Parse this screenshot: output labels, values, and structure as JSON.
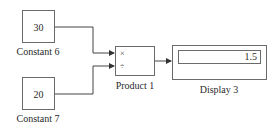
{
  "diagram": {
    "blocks": {
      "constant6": {
        "value": "30",
        "label": "Constant 6"
      },
      "constant7": {
        "value": "20",
        "label": "Constant 7"
      },
      "product1": {
        "label": "Product 1",
        "ports": [
          "×",
          "÷"
        ]
      },
      "display3": {
        "value": "1.5",
        "label": "Display 3"
      }
    },
    "connections": [
      {
        "from": "Constant 6",
        "to": "Product 1 (×)"
      },
      {
        "from": "Constant 7",
        "to": "Product 1 (÷)"
      },
      {
        "from": "Product 1",
        "to": "Display 3"
      }
    ],
    "colors": {
      "stroke": "#6a6a6a",
      "wire": "#444444",
      "background": "#ffffff"
    }
  }
}
